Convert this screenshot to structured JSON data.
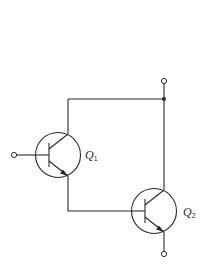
{
  "diagram": {
    "type": "darlington-pair",
    "transistors": [
      {
        "id": "Q1",
        "label": "Q",
        "subscript": "1",
        "kind": "NPN"
      },
      {
        "id": "Q2",
        "label": "Q",
        "subscript": "2",
        "kind": "NPN"
      }
    ],
    "terminals": [
      "base-input",
      "collector-top",
      "emitter-bottom"
    ],
    "colors": {
      "line": "#2a2a2a",
      "background": "#ffffff"
    }
  }
}
